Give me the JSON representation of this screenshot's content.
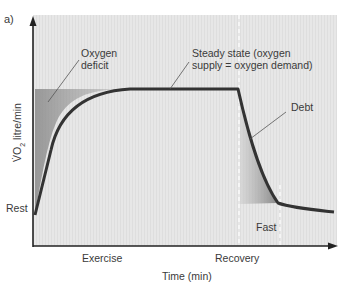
{
  "panel_label": "a)",
  "axes": {
    "y_label_dot": "V̇O",
    "y_label_sub": "2",
    "y_label_rest": " litre/min",
    "x_label": "Time (min)",
    "y_tick_rest": "Rest",
    "x_phase_exercise": "Exercise",
    "x_phase_recovery": "Recovery"
  },
  "annotations": {
    "oxygen_deficit_line1": "Oxygen",
    "oxygen_deficit_line2": "deficit",
    "steady_state_line1": "Steady state (oxygen",
    "steady_state_line2": "supply = oxygen demand)",
    "debt": "Debt",
    "fast": "Fast"
  },
  "colors": {
    "background": "#e6e6e6",
    "curve": "#333333",
    "shade": "#8c8c8c",
    "axis": "#222222"
  }
}
